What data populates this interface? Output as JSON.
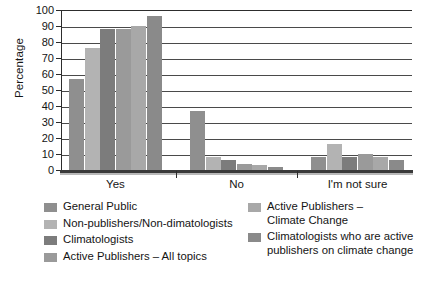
{
  "chart_data": {
    "type": "bar",
    "title": "",
    "xlabel": "",
    "ylabel": "Percentage",
    "ylim": [
      0,
      100
    ],
    "ytick_values": [
      0,
      10,
      20,
      30,
      40,
      50,
      60,
      70,
      80,
      90,
      100
    ],
    "ytick_labels": [
      "0",
      "10",
      "20",
      "30",
      "40",
      "50",
      "60",
      "70",
      "80",
      "90",
      "100"
    ],
    "grid": true,
    "grid_axis": "y",
    "legend_position": "below",
    "categories": [
      "Yes",
      "No",
      "I'm not sure"
    ],
    "series": [
      {
        "name": "General Public",
        "color": "#8f8f8f",
        "values": [
          57,
          37,
          8
        ]
      },
      {
        "name": "Non-publishers/Non-dimatologists",
        "color": "#b3b3b3",
        "values": [
          76,
          8,
          16
        ]
      },
      {
        "name": "Climatologists",
        "color": "#7c7c7c",
        "values": [
          88,
          6,
          8
        ]
      },
      {
        "name": "Active Publishers – All topics",
        "color": "#9a9a9a",
        "values": [
          88,
          4,
          10
        ]
      },
      {
        "name": "Active Publishers –\nClimate Change",
        "color": "#a8a8a8",
        "values": [
          90,
          3,
          8
        ]
      },
      {
        "name": "Climatologists who are active\npublishers on climate change",
        "color": "#8a8a8a",
        "values": [
          96,
          2,
          6
        ]
      }
    ]
  },
  "legend": {
    "columns": [
      {
        "items": [
          {
            "label": "General Public",
            "color": "#8f8f8f"
          },
          {
            "label": "Non-publishers/Non-dimatologists",
            "color": "#b3b3b3"
          },
          {
            "label": "Climatologists",
            "color": "#7c7c7c"
          },
          {
            "label": "Active Publishers – All topics",
            "color": "#9a9a9a"
          }
        ]
      },
      {
        "items": [
          {
            "label": "Active Publishers –\nClimate Change",
            "color": "#a8a8a8"
          },
          {
            "label": "Climatologists who are active\npublishers on climate change",
            "color": "#8a8a8a"
          }
        ]
      }
    ]
  },
  "axes": {
    "y_title": "Percentage",
    "x_categories": [
      "Yes",
      "No",
      "I'm not sure"
    ]
  }
}
